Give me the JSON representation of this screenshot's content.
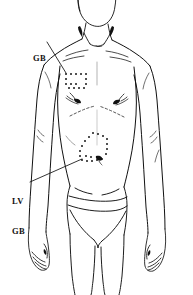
{
  "figure": {
    "kind": "anatomical-line-drawing",
    "view": "anterior-torso",
    "background_color": "#ffffff",
    "ink_color": "#111111",
    "width": 193,
    "height": 295
  },
  "annotations": {
    "upper": {
      "id": "gb-upper",
      "label": "GB",
      "label_lines": [
        "GB"
      ],
      "meaning": "Gall Bladder channel region",
      "label_x": 33,
      "label_y": 33,
      "leader_from_x": 47,
      "leader_from_y": 42,
      "leader_to_x": 66,
      "leader_to_y": 73,
      "region_x": 64,
      "region_y": 73,
      "region_w": 24,
      "region_h": 19
    },
    "lower": {
      "id": "lv-gb-lower",
      "label": "LV\nGB",
      "label_lines": [
        "LV",
        "GB"
      ],
      "meaning": "Liver and Gall Bladder channel region",
      "label_x": 12,
      "label_y": 176,
      "leader_from_x": 30,
      "leader_from_y": 182,
      "leader_to_x": 82,
      "leader_to_y": 159,
      "region_x": 78,
      "region_y": 132,
      "region_w": 30,
      "region_h": 32
    }
  },
  "marking_dots": {
    "dot_color": "#111111",
    "dot_size": 1.7,
    "upper_patch": [
      [
        66,
        74
      ],
      [
        71,
        74
      ],
      [
        76,
        74
      ],
      [
        81,
        74
      ],
      [
        86,
        74
      ],
      [
        66,
        79
      ],
      [
        86,
        79
      ],
      [
        66,
        84
      ],
      [
        71,
        84
      ],
      [
        76,
        84
      ],
      [
        69,
        88
      ],
      [
        74,
        88
      ],
      [
        79,
        88
      ],
      [
        84,
        88
      ],
      [
        86,
        84
      ]
    ],
    "lower_patch": [
      [
        93,
        133
      ],
      [
        98,
        134
      ],
      [
        103,
        136
      ],
      [
        107,
        139
      ],
      [
        89,
        137
      ],
      [
        85,
        141
      ],
      [
        82,
        146
      ],
      [
        107,
        144
      ],
      [
        107,
        149
      ],
      [
        106,
        154
      ],
      [
        80,
        151
      ],
      [
        80,
        156
      ],
      [
        82,
        160
      ],
      [
        87,
        161
      ],
      [
        92,
        161
      ],
      [
        97,
        160
      ],
      [
        102,
        159
      ],
      [
        86,
        156
      ],
      [
        91,
        157
      ]
    ]
  },
  "body_parts": [
    "head-chin",
    "neck",
    "clavicles",
    "shoulders",
    "left-arm",
    "right-arm",
    "left-hand",
    "right-hand",
    "chest",
    "nipples",
    "costal-margin",
    "abdomen",
    "navel",
    "hips",
    "underwear-briefs",
    "thighs"
  ]
}
